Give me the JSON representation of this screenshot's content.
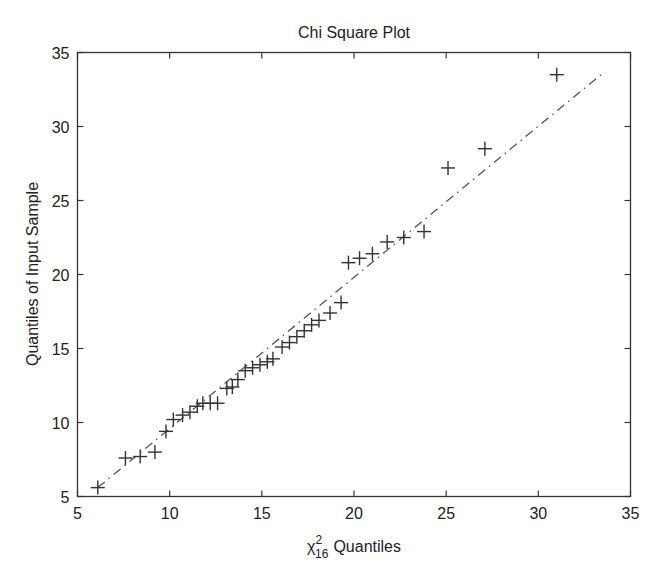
{
  "chart_data": {
    "type": "scatter",
    "title": "Chi Square Plot",
    "xlabel": "χ²₁₆ Quantiles",
    "xlabel_parts": {
      "symbol": "χ",
      "superscript": "2",
      "subscript": "16",
      "text": "Quantiles"
    },
    "ylabel": "Quantiles of Input Sample",
    "xlim": [
      5,
      35
    ],
    "ylim": [
      5,
      35
    ],
    "xticks": [
      5,
      10,
      15,
      20,
      25,
      30,
      35
    ],
    "yticks": [
      5,
      10,
      15,
      20,
      25,
      30,
      35
    ],
    "grid": false,
    "legend": null,
    "marker": "+",
    "series": [
      {
        "name": "sample",
        "points": [
          [
            6.1,
            5.6
          ],
          [
            7.6,
            7.6
          ],
          [
            8.4,
            7.7
          ],
          [
            9.2,
            8.0
          ],
          [
            9.8,
            9.4
          ],
          [
            10.2,
            10.2
          ],
          [
            10.7,
            10.5
          ],
          [
            11.1,
            10.7
          ],
          [
            11.5,
            11.1
          ],
          [
            11.8,
            11.3
          ],
          [
            12.2,
            11.3
          ],
          [
            12.6,
            11.3
          ],
          [
            13.1,
            12.3
          ],
          [
            13.4,
            12.4
          ],
          [
            13.7,
            12.9
          ],
          [
            14.1,
            13.5
          ],
          [
            14.5,
            13.7
          ],
          [
            14.9,
            13.9
          ],
          [
            15.3,
            14.1
          ],
          [
            15.6,
            14.3
          ],
          [
            16.1,
            15.1
          ],
          [
            16.5,
            15.4
          ],
          [
            16.9,
            15.8
          ],
          [
            17.3,
            16.2
          ],
          [
            17.7,
            16.6
          ],
          [
            18.1,
            16.9
          ],
          [
            18.7,
            17.4
          ],
          [
            19.3,
            18.1
          ],
          [
            19.7,
            20.8
          ],
          [
            20.3,
            21.1
          ],
          [
            21.0,
            21.4
          ],
          [
            21.8,
            22.2
          ],
          [
            22.7,
            22.5
          ],
          [
            23.8,
            22.9
          ],
          [
            25.1,
            27.2
          ],
          [
            27.1,
            28.5
          ],
          [
            31.0,
            33.5
          ]
        ]
      }
    ],
    "reference_line": {
      "style": "dash-dot",
      "from": [
        6.1,
        5.6
      ],
      "to": [
        33.5,
        33.6
      ]
    }
  }
}
